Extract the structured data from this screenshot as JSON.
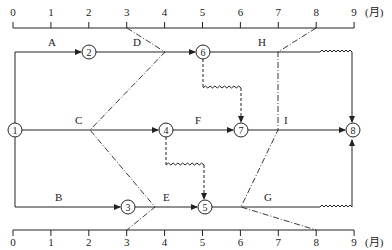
{
  "axis": {
    "unit_label": "(月)",
    "ticks": [
      "0",
      "1",
      "2",
      "3",
      "4",
      "5",
      "6",
      "7",
      "8",
      "9"
    ]
  },
  "nodes": [
    {
      "id": "1",
      "label": "1"
    },
    {
      "id": "2",
      "label": "2"
    },
    {
      "id": "3",
      "label": "3"
    },
    {
      "id": "4",
      "label": "4"
    },
    {
      "id": "5",
      "label": "5"
    },
    {
      "id": "6",
      "label": "6"
    },
    {
      "id": "7",
      "label": "7"
    },
    {
      "id": "8",
      "label": "8"
    }
  ],
  "activities": [
    {
      "name": "A",
      "from": "1",
      "to": "2",
      "start": 0,
      "end": 2
    },
    {
      "name": "B",
      "from": "1",
      "to": "3",
      "start": 0,
      "end": 3
    },
    {
      "name": "C",
      "from": "1",
      "to": "4",
      "start": 0,
      "end": 4
    },
    {
      "name": "D",
      "from": "2",
      "to": "6",
      "start": 2,
      "end": 5
    },
    {
      "name": "E",
      "from": "3",
      "to": "5",
      "start": 3,
      "end": 5
    },
    {
      "name": "F",
      "from": "4",
      "to": "7",
      "start": 4,
      "end": 6
    },
    {
      "name": "G",
      "from": "5",
      "to": "8",
      "start": 5,
      "end": 8,
      "free_float": 1
    },
    {
      "name": "H",
      "from": "6",
      "to": "8",
      "start": 5,
      "end": 8,
      "free_float": 1
    },
    {
      "name": "I",
      "from": "7",
      "to": "8",
      "start": 6,
      "end": 9
    }
  ],
  "dummies": [
    {
      "from": "6",
      "to": "7",
      "float": 1
    },
    {
      "from": "4",
      "to": "5",
      "float": 1
    }
  ],
  "check_lines": [
    {
      "name": "check-line-month-3",
      "axis_time": 3,
      "progress": {
        "D": 4,
        "C": 2,
        "E": 4
      }
    },
    {
      "name": "check-line-month-8",
      "axis_time": 8,
      "progress": {
        "H": 7,
        "I": 7,
        "G": 6
      }
    }
  ]
}
